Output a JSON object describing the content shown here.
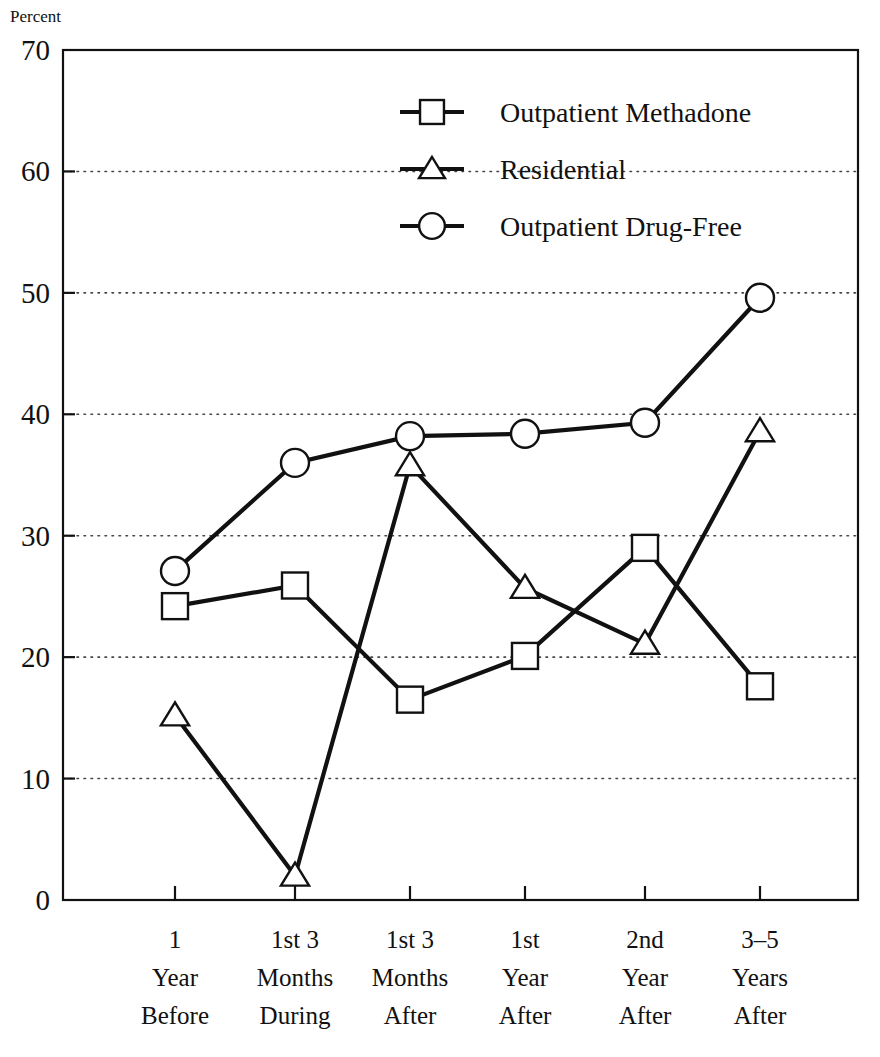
{
  "chart_data": {
    "type": "line",
    "title": "",
    "xlabel": "",
    "ylabel": "Percent",
    "ylim": [
      0,
      70
    ],
    "ytick_step": 10,
    "grid": true,
    "grid_axis": "y",
    "legend_position": "top-center-right",
    "categories": [
      "1 Year Before",
      "1st 3 Months During",
      "1st 3 Months After",
      "1st Year After",
      "2nd Year After",
      "3–5 Years After"
    ],
    "category_lines": [
      [
        "1",
        "Year",
        "Before"
      ],
      [
        "1st 3",
        "Months",
        "During"
      ],
      [
        "1st 3",
        "Months",
        "After"
      ],
      [
        "1st",
        "Year",
        "After"
      ],
      [
        "2nd",
        "Year",
        "After"
      ],
      [
        "3–5",
        "Years",
        "After"
      ]
    ],
    "ytick_labels": [
      "0",
      "10",
      "20",
      "30",
      "40",
      "50",
      "60",
      "70"
    ],
    "ytick_values": [
      0,
      10,
      20,
      30,
      40,
      50,
      60,
      70
    ],
    "series": [
      {
        "name": "Outpatient Methadone",
        "marker": "square",
        "values": [
          24.2,
          25.9,
          16.5,
          20.1,
          29.0,
          17.6
        ]
      },
      {
        "name": "Residential",
        "marker": "triangle",
        "values": [
          15.2,
          2.0,
          35.8,
          25.7,
          21.1,
          38.6
        ]
      },
      {
        "name": "Outpatient Drug-Free",
        "marker": "circle",
        "values": [
          27.1,
          36.0,
          38.2,
          38.4,
          39.3,
          49.6
        ]
      }
    ],
    "colors": {
      "line": "#111111",
      "marker_fill": "#ffffff",
      "grid": "#444444",
      "background": "#ffffff"
    }
  },
  "legend": {
    "items": [
      {
        "label": "Outpatient Methadone",
        "marker": "square"
      },
      {
        "label": "Residential",
        "marker": "triangle"
      },
      {
        "label": "Outpatient Drug-Free",
        "marker": "circle"
      }
    ]
  },
  "axis": {
    "y_title": "Percent"
  }
}
